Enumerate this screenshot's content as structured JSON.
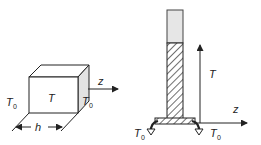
{
  "figure": {
    "left_panel": {
      "block_label": "T",
      "left_face_label": "T0",
      "right_face_label": "T0",
      "axis_label": "z",
      "width_label": "h"
    },
    "right_panel": {
      "vertical_axis_label": "T",
      "horizontal_axis_label": "z",
      "left_base_label": "T0",
      "right_base_label": "T0"
    },
    "colors": {
      "line": "#222222",
      "shaded_face": "#e2e2e2",
      "column_fill": "#e6e6e6"
    }
  }
}
